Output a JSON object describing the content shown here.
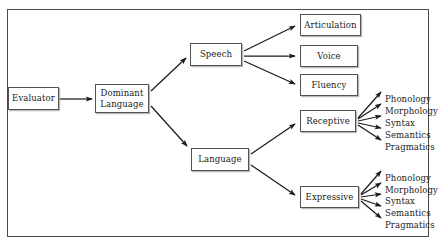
{
  "diagram": {
    "frame": {
      "border_color": "#4a4a4a"
    },
    "colors": {
      "box_border": "#55514e",
      "arrow": "#1b1b1b",
      "text": "#1b1b1b",
      "background": "#ffffff"
    },
    "nodes": {
      "evaluator": {
        "label": "Evaluator",
        "x": 8,
        "y": 87,
        "w": 51,
        "h": 23
      },
      "dominant_language": {
        "line1": "Dominant",
        "line2": "Language",
        "x": 95,
        "y": 84,
        "w": 54,
        "h": 29
      },
      "speech": {
        "label": "Speech",
        "x": 190,
        "y": 43,
        "w": 52,
        "h": 23
      },
      "language": {
        "label": "Language",
        "x": 191,
        "y": 148,
        "w": 58,
        "h": 23
      },
      "articulation": {
        "label": "Articulation",
        "x": 300,
        "y": 14,
        "w": 61,
        "h": 22
      },
      "voice": {
        "label": "Voice",
        "x": 300,
        "y": 45,
        "w": 58,
        "h": 22
      },
      "fluency": {
        "label": "Fluency",
        "x": 300,
        "y": 74,
        "w": 58,
        "h": 22
      },
      "receptive": {
        "label": "Receptive",
        "x": 300,
        "y": 110,
        "w": 56,
        "h": 22
      },
      "expressive": {
        "label": "Expressive",
        "x": 300,
        "y": 186,
        "w": 59,
        "h": 22
      }
    },
    "receptive_leaves": [
      {
        "label": "Phonology",
        "x": 385,
        "y": 94
      },
      {
        "label": "Morphology",
        "x": 385,
        "y": 106
      },
      {
        "label": "Syntax",
        "x": 385,
        "y": 118
      },
      {
        "label": "Semantics",
        "x": 385,
        "y": 130
      },
      {
        "label": "Pragmatics",
        "x": 385,
        "y": 142
      }
    ],
    "expressive_leaves": [
      {
        "label": "Phonology",
        "x": 385,
        "y": 173
      },
      {
        "label": "Morphology",
        "x": 385,
        "y": 185
      },
      {
        "label": "Syntax",
        "x": 385,
        "y": 196
      },
      {
        "label": "Semantics",
        "x": 385,
        "y": 208
      },
      {
        "label": "Pragmatics",
        "x": 385,
        "y": 220
      }
    ],
    "edges": [
      {
        "from": "evaluator",
        "to": "dominant_language"
      },
      {
        "from": "dominant_language",
        "to": "speech"
      },
      {
        "from": "dominant_language",
        "to": "language"
      },
      {
        "from": "speech",
        "to": "articulation"
      },
      {
        "from": "speech",
        "to": "voice"
      },
      {
        "from": "speech",
        "to": "fluency"
      },
      {
        "from": "language",
        "to": "receptive"
      },
      {
        "from": "language",
        "to": "expressive"
      },
      {
        "from": "receptive",
        "to": "Phonology"
      },
      {
        "from": "receptive",
        "to": "Morphology"
      },
      {
        "from": "receptive",
        "to": "Syntax"
      },
      {
        "from": "receptive",
        "to": "Semantics"
      },
      {
        "from": "receptive",
        "to": "Pragmatics"
      },
      {
        "from": "expressive",
        "to": "Phonology"
      },
      {
        "from": "expressive",
        "to": "Morphology"
      },
      {
        "from": "expressive",
        "to": "Syntax"
      },
      {
        "from": "expressive",
        "to": "Semantics"
      },
      {
        "from": "expressive",
        "to": "Pragmatics"
      }
    ]
  }
}
